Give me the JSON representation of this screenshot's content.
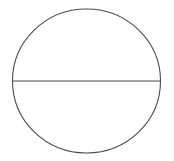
{
  "diagram": {
    "canvas": {
      "width": 174,
      "height": 161,
      "background": "#ffffff"
    },
    "stroke_color": "#4a4a4a",
    "stroke_width": 1.1,
    "shapes": [
      {
        "type": "ellipse",
        "name": "circle",
        "cx": 86.5,
        "cy": 81,
        "rx": 74,
        "ry": 72
      },
      {
        "type": "line",
        "name": "diameter",
        "x1": 12.5,
        "y1": 81,
        "x2": 160.5,
        "y2": 81
      }
    ]
  }
}
